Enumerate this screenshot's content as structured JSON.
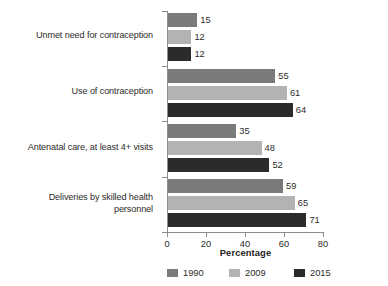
{
  "chart_data": {
    "type": "bar",
    "orientation": "horizontal",
    "title": "",
    "xlabel": "Percentage",
    "ylabel": "",
    "xlim": [
      0,
      80
    ],
    "xticks": [
      0,
      20,
      40,
      60,
      80
    ],
    "grid": false,
    "legend_position": "bottom",
    "categories": [
      "Unmet need for contraception",
      "Use of contraception",
      "Antenatal care, at least 4+ visits",
      "Deliveries by skilled health\npersonnel"
    ],
    "series": [
      {
        "name": "1990",
        "color": "#7a7a7a",
        "values": [
          15,
          55,
          35,
          59
        ]
      },
      {
        "name": "2009",
        "color": "#b3b3b3",
        "values": [
          12,
          61,
          48,
          65
        ]
      },
      {
        "name": "2015",
        "color": "#2b2b2b",
        "values": [
          12,
          64,
          52,
          71
        ]
      }
    ],
    "data_labels": [
      [
        "15",
        "12",
        "12"
      ],
      [
        "55",
        "61",
        "64"
      ],
      [
        "35",
        "48",
        "52"
      ],
      [
        "59",
        "65",
        "71"
      ]
    ]
  },
  "axis": {
    "tick_labels": [
      "0",
      "20",
      "40",
      "60",
      "80"
    ],
    "x_title": "Percentage"
  },
  "legend": {
    "items": [
      {
        "label": "1990"
      },
      {
        "label": "2009"
      },
      {
        "label": "2015"
      }
    ]
  }
}
